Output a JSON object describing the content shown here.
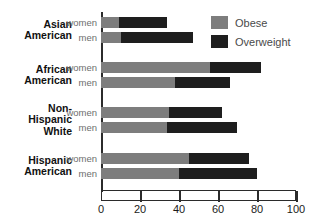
{
  "chart_data": {
    "type": "bar",
    "orientation": "horizontal",
    "stacked": true,
    "title": "",
    "xlabel": "",
    "ylabel": "",
    "xlim": [
      0,
      100
    ],
    "xticks": [
      0,
      20,
      40,
      60,
      80,
      100
    ],
    "grid": false,
    "legend_position": "top-right",
    "legend": [
      {
        "name": "Obese",
        "color": "#7d7d7d"
      },
      {
        "name": "Overweight",
        "color": "#1e1e1e"
      }
    ],
    "series": [
      {
        "name": "Obese",
        "values": [
          9,
          10,
          56,
          38,
          35,
          34,
          45,
          40
        ]
      },
      {
        "name": "Overweight",
        "values": [
          25,
          37,
          26,
          28,
          27,
          36,
          31,
          40
        ]
      }
    ],
    "groups": [
      {
        "label_lines": [
          "Asian",
          "American"
        ],
        "rows": [
          {
            "series_label": "women",
            "obese": 9,
            "overweight": 25,
            "total": 34
          },
          {
            "series_label": "men",
            "obese": 10,
            "overweight": 37,
            "total": 47
          }
        ]
      },
      {
        "label_lines": [
          "African",
          "American"
        ],
        "rows": [
          {
            "series_label": "women",
            "obese": 56,
            "overweight": 26,
            "total": 82
          },
          {
            "series_label": "men",
            "obese": 38,
            "overweight": 28,
            "total": 66
          }
        ]
      },
      {
        "label_lines": [
          "Non-",
          "Hispanic",
          "White"
        ],
        "rows": [
          {
            "series_label": "women",
            "obese": 35,
            "overweight": 27,
            "total": 62
          },
          {
            "series_label": "men",
            "obese": 34,
            "overweight": 36,
            "total": 70
          }
        ]
      },
      {
        "label_lines": [
          "Hispanic",
          "American"
        ],
        "rows": [
          {
            "series_label": "women",
            "obese": 45,
            "overweight": 31,
            "total": 76
          },
          {
            "series_label": "men",
            "obese": 40,
            "overweight": 40,
            "total": 80
          }
        ]
      }
    ]
  },
  "colors": {
    "obese": "#7d7d7d",
    "overweight": "#1e1e1e",
    "axis": "#2b2b2b",
    "group_label": "#111111",
    "series_label": "#6e6e6e",
    "background": "#ffffff"
  }
}
